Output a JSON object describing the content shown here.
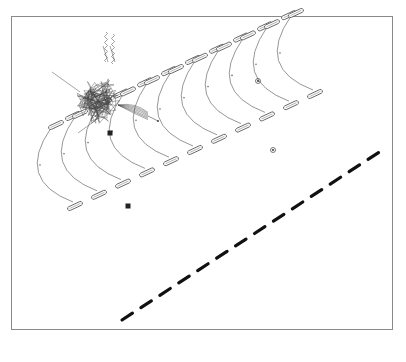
{
  "figure": {
    "frame": {
      "x": 11,
      "y": 16,
      "width": 382,
      "height": 314,
      "border_color": "#8a8a8a"
    },
    "colors": {
      "line": "#6a6a6a",
      "capsule": "#555555",
      "dash": "#111111",
      "cluster": "#444444",
      "marker": "#222222"
    },
    "cluster": {
      "cx": 100,
      "cy": 100,
      "labels": [
        "nm",
        "Fibre",
        "Sp"
      ]
    },
    "arc_units": {
      "count": 11,
      "start": {
        "x": 45,
        "y": 200
      },
      "step": {
        "dx": 24,
        "dy": -11.2
      },
      "arc_height": 70
    },
    "markers": [
      {
        "x": 110,
        "y": 133,
        "shape": "square"
      },
      {
        "x": 128,
        "y": 206,
        "shape": "square"
      },
      {
        "x": 258,
        "y": 81,
        "shape": "glyph"
      },
      {
        "x": 273,
        "y": 150,
        "shape": "glyph"
      }
    ],
    "dashed_line": {
      "x1": 122,
      "y1": 320,
      "x2": 387,
      "y2": 147,
      "segments": 14
    }
  }
}
